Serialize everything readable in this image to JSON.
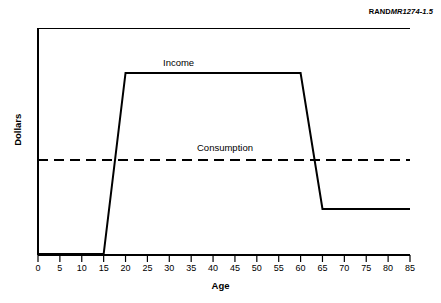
{
  "credit": {
    "publisher": "RAND",
    "document_number": "MR1274-1.5"
  },
  "chart_data": {
    "type": "line",
    "title": "",
    "subtitle": "",
    "xlabel": "Age",
    "ylabel": "Dollars",
    "xlim": [
      0,
      85
    ],
    "ylim": [
      0,
      100
    ],
    "grid": false,
    "legend_position": "inline-annotations",
    "xticks": [
      0,
      5,
      10,
      15,
      20,
      25,
      30,
      35,
      40,
      45,
      50,
      55,
      60,
      65,
      70,
      75,
      80,
      85
    ],
    "xtick_labels": [
      "0",
      "5",
      "10",
      "15",
      "20",
      "25",
      "30",
      "35",
      "40",
      "45",
      "50",
      "55",
      "60",
      "65",
      "70",
      "75",
      "80",
      "85"
    ],
    "yticks": [],
    "ytick_labels": [],
    "series": [
      {
        "name": "Income",
        "style": "solid",
        "color": "#000000",
        "annotation": "Income",
        "annotation_x": 27,
        "annotation_y": 88,
        "x": [
          0,
          15,
          20,
          60,
          65,
          85
        ],
        "y": [
          0,
          0,
          80,
          80,
          20,
          20
        ]
      },
      {
        "name": "Consumption",
        "style": "dashed",
        "color": "#000000",
        "annotation": "Consumption",
        "annotation_x": 36,
        "annotation_y": 47,
        "x": [
          0,
          85
        ],
        "y": [
          42,
          42
        ]
      }
    ],
    "annotations": [
      {
        "text": "Income",
        "x": 27,
        "y": 88
      },
      {
        "text": "Consumption",
        "x": 36,
        "y": 47
      }
    ]
  }
}
